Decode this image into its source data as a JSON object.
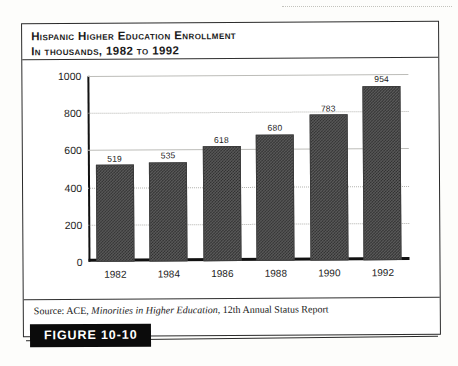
{
  "figure": {
    "title_line1": "Hispanic Higher Education Enrollment",
    "title_line2": "In thousands, 1982 to 1992",
    "tag_label": "FIGURE 10-10",
    "source_prefix": "Source: ACE, ",
    "source_italic": "Minorities in Higher Education",
    "source_suffix": ", 12th Annual Status Report"
  },
  "chart_data": {
    "type": "bar",
    "title": "Hispanic Higher Education Enrollment",
    "subtitle": "In thousands, 1982 to 1992",
    "xlabel": "",
    "ylabel": "",
    "categories": [
      "1982",
      "1984",
      "1986",
      "1988",
      "1990",
      "1992"
    ],
    "values": [
      519,
      535,
      618,
      680,
      783,
      954
    ],
    "value_labels": [
      "519",
      "535",
      "618",
      "680",
      "783",
      "954"
    ],
    "ylim": [
      0,
      1000
    ],
    "yticks": [
      1000,
      800,
      600,
      400,
      200,
      0
    ],
    "ytick_labels": [
      "1000",
      "800",
      "600",
      "400",
      "200",
      "0"
    ],
    "grid": true,
    "gridline_styles": [
      "solid",
      "dotted",
      "solid",
      "dotted",
      "dotted",
      "solid"
    ],
    "legend": "none",
    "bar_color": "#4a4a4a",
    "bar_pattern": "checker-dither",
    "source": "Source: ACE, Minorities in Higher Education, 12th Annual Status Report"
  }
}
